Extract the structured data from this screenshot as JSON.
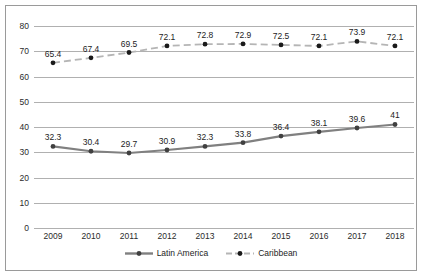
{
  "chart_data": {
    "type": "line",
    "title": "",
    "subtitle": "",
    "xlabel": "",
    "ylabel": "",
    "categories": [
      "2009",
      "2010",
      "2011",
      "2012",
      "2013",
      "2014",
      "2015",
      "2016",
      "2017",
      "2018"
    ],
    "ylim": [
      0,
      80
    ],
    "yticks": [
      "0",
      "10",
      "20",
      "30",
      "40",
      "50",
      "60",
      "70",
      "80"
    ],
    "grid": true,
    "legend_position": "bottom",
    "series": [
      {
        "name": "Latin America",
        "values": [
          32.3,
          30.4,
          29.7,
          30.9,
          32.3,
          33.8,
          36.4,
          38.1,
          39.6,
          41
        ],
        "labels": [
          "32.3",
          "30.4",
          "29.7",
          "30.9",
          "32.3",
          "33.8",
          "36.4",
          "38.1",
          "39.6",
          "41"
        ],
        "color": "#808080",
        "marker_color": "#404040",
        "line_style": "solid"
      },
      {
        "name": "Caribbean",
        "values": [
          65.4,
          67.4,
          69.5,
          72.1,
          72.8,
          72.9,
          72.5,
          72.1,
          73.9,
          72.1
        ],
        "labels": [
          "65.4",
          "67.4",
          "69.5",
          "72.1",
          "72.8",
          "72.9",
          "72.5",
          "72.1",
          "73.9",
          "72.1"
        ],
        "color": "#b5b5b5",
        "marker_color": "#1a1a1a",
        "line_style": "dashed"
      }
    ]
  },
  "legend": {
    "items": [
      {
        "label": "Latin America"
      },
      {
        "label": "Caribbean"
      }
    ]
  },
  "colors": {
    "border": "#9a9a9a",
    "gridline": "#b0b0b0",
    "background": "#ffffff",
    "text": "#2b2b2b"
  }
}
